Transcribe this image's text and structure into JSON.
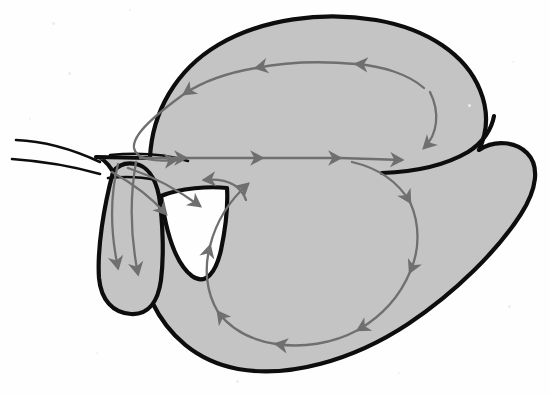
{
  "figure": {
    "domain_note": "scanned biological line drawing",
    "caption": "",
    "background_color": "#fefefe",
    "body_fill_color": "#c4c4c4",
    "body_outline_color": "#0d0d0d",
    "arrow_color": "#6f6f6f",
    "body_outline_width": 4.2,
    "arrow_stroke_width": 2.3,
    "canvas": {
      "width": 550,
      "height": 395
    }
  },
  "shapes": {
    "body_outline_label": "main-body-silhouette",
    "body_path": "M 148 160 C 150 100 195 42 268 26 C 340 11 420 22 462 55 C 492 79 500 115 495 147 C 515 140 532 148 536 162 C 541 180 528 205 505 232 C 470 275 420 325 360 355 C 300 385 230 383 190 358 C 152 334 128 300 120 270 C 113 243 112 215 110 196 C 108 180 104 168 98 162 Z",
    "left_lower_lobe_path": "M 110 196 C 104 232 100 270 104 292 C 108 312 126 318 140 310 C 152 302 155 282 156 258 C 157 232 156 208 152 190 Z",
    "notch_path": "M 152 190 C 158 225 168 252 183 262 C 196 270 206 258 212 240 C 217 224 219 206 219 192 Z",
    "whisker_1": "M 16 142 C 40 142 70 150 96 162",
    "whisker_2": "M 12 160 C 38 162 70 166 96 172",
    "tick_1": "M 112 153 C 140 151 168 154 186 160",
    "tick_2": "M 110 176 C 130 174 145 175 158 178"
  },
  "arrow_groups": [
    {
      "name": "upper-loop",
      "description": "Counterclockwise loop in the upper dorsal lobe",
      "direction": "counterclockwise",
      "arrow_count": 5
    },
    {
      "name": "midline-track",
      "description": "Horizontal track with four rightward arrows across the middle",
      "direction": "rightward",
      "arrow_count": 4
    },
    {
      "name": "lower-loop",
      "description": "Counterclockwise loop in the lower ventral lobe",
      "direction": "counterclockwise",
      "arrow_count": 6
    },
    {
      "name": "left-lobe-descending",
      "description": "Two parallel arrows descending into the left lower lobe",
      "direction": "downward",
      "arrow_count": 2
    },
    {
      "name": "notch-branch",
      "description": "Two arrows curving down-right toward the notch",
      "direction": "down-right",
      "arrow_count": 2
    },
    {
      "name": "return-hook",
      "description": "Short hooked arrow pointing left back toward the midline junction",
      "direction": "leftward",
      "arrow_count": 1
    }
  ],
  "specks": [
    {
      "x": 52,
      "y": 22,
      "size": 3,
      "shade": "#ededed"
    },
    {
      "x": 129,
      "y": 9,
      "size": 2,
      "shade": "#efefef"
    },
    {
      "x": 68,
      "y": 72,
      "size": 3,
      "shade": "#ececec"
    },
    {
      "x": 29,
      "y": 118,
      "size": 2,
      "shade": "#efefef"
    },
    {
      "x": 468,
      "y": 104,
      "size": 3,
      "shade": "#ededed"
    },
    {
      "x": 512,
      "y": 61,
      "size": 2,
      "shade": "#efefef"
    },
    {
      "x": 508,
      "y": 305,
      "size": 3,
      "shade": "#ededed"
    },
    {
      "x": 96,
      "y": 352,
      "size": 2,
      "shade": "#efefef"
    },
    {
      "x": 236,
      "y": 380,
      "size": 3,
      "shade": "#ededed"
    },
    {
      "x": 398,
      "y": 372,
      "size": 2,
      "shade": "#efefef"
    }
  ]
}
